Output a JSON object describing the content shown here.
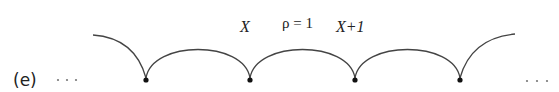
{
  "figure": {
    "panel_label": "(e)",
    "left_ellipsis": "· · ·",
    "right_ellipsis": "· · ·",
    "labels": {
      "x": "X",
      "rho": "ρ = 1",
      "x_plus_1": "X+1"
    },
    "nodes_x": [
      146,
      250,
      355,
      460
    ],
    "node_y": 80,
    "arc_peak_y": 34,
    "colors": {
      "stroke": "#444444",
      "node": "#111111",
      "text": "#222222"
    }
  }
}
